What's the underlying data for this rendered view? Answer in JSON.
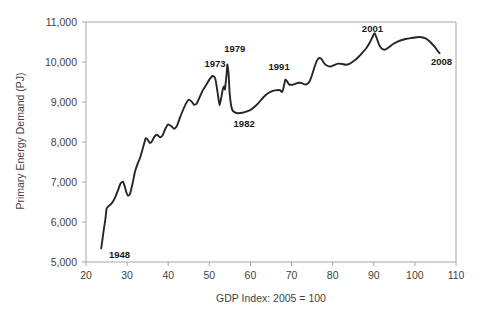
{
  "chart_data": {
    "type": "line",
    "title": "",
    "xlabel": "GDP Index: 2005 = 100",
    "ylabel": "Primary Energy Demand (PJ)",
    "xlim": [
      20,
      110
    ],
    "ylim": [
      5000,
      11000
    ],
    "xticks": [
      20,
      30,
      40,
      50,
      60,
      70,
      80,
      90,
      100,
      110
    ],
    "xtick_labels": [
      "20",
      "30",
      "40",
      "50",
      "60",
      "70",
      "80",
      "90",
      "100",
      "110"
    ],
    "yticks": [
      5000,
      6000,
      7000,
      8000,
      9000,
      10000,
      11000
    ],
    "ytick_labels": [
      "5,000",
      "6,000",
      "7,000",
      "8,000",
      "9,000",
      "10,000",
      "11,000"
    ],
    "grid": false,
    "legend": "none",
    "line_color": "#262626",
    "axis_color": "#a6a6a6",
    "text_color": "#3f3f3f",
    "annotations": [
      {
        "label": "1948",
        "x": 25.6,
        "y": 5180,
        "anchor": "start"
      },
      {
        "label": "1973",
        "x": 48.8,
        "y": 9960,
        "anchor": "start"
      },
      {
        "label": "1979",
        "x": 53.6,
        "y": 10330,
        "anchor": "start"
      },
      {
        "label": "1982",
        "x": 55.9,
        "y": 8460,
        "anchor": "start"
      },
      {
        "label": "1991",
        "x": 64.4,
        "y": 9880,
        "anchor": "start"
      },
      {
        "label": "2001",
        "x": 87.1,
        "y": 10830,
        "anchor": "start"
      },
      {
        "label": "2008",
        "x": 103.9,
        "y": 10010,
        "anchor": "start"
      }
    ],
    "series": [
      {
        "name": "Primary Energy Demand vs GDP Index",
        "points": [
          [
            23.7,
            5340
          ],
          [
            24.0,
            5560
          ],
          [
            24.3,
            5790
          ],
          [
            24.7,
            6060
          ],
          [
            25.0,
            6330
          ],
          [
            25.4,
            6390
          ],
          [
            26.0,
            6440
          ],
          [
            26.6,
            6520
          ],
          [
            27.2,
            6640
          ],
          [
            27.8,
            6800
          ],
          [
            28.4,
            6960
          ],
          [
            29.0,
            7010
          ],
          [
            29.4,
            6900
          ],
          [
            29.8,
            6750
          ],
          [
            30.2,
            6660
          ],
          [
            30.7,
            6700
          ],
          [
            31.3,
            6950
          ],
          [
            31.9,
            7250
          ],
          [
            32.5,
            7440
          ],
          [
            33.2,
            7620
          ],
          [
            33.9,
            7870
          ],
          [
            34.5,
            8090
          ],
          [
            35.0,
            8060
          ],
          [
            35.5,
            7980
          ],
          [
            36.0,
            8010
          ],
          [
            36.6,
            8130
          ],
          [
            37.3,
            8180
          ],
          [
            38.0,
            8120
          ],
          [
            38.6,
            8160
          ],
          [
            39.3,
            8330
          ],
          [
            40.0,
            8440
          ],
          [
            40.7,
            8400
          ],
          [
            41.4,
            8330
          ],
          [
            42.1,
            8400
          ],
          [
            42.9,
            8620
          ],
          [
            43.6,
            8800
          ],
          [
            44.3,
            8960
          ],
          [
            45.0,
            9060
          ],
          [
            45.7,
            9010
          ],
          [
            46.3,
            8930
          ],
          [
            46.9,
            8960
          ],
          [
            47.6,
            9110
          ],
          [
            48.4,
            9290
          ],
          [
            49.2,
            9420
          ],
          [
            50.0,
            9560
          ],
          [
            50.8,
            9650
          ],
          [
            51.4,
            9600
          ],
          [
            51.8,
            9380
          ],
          [
            52.2,
            9100
          ],
          [
            52.5,
            8920
          ],
          [
            52.9,
            9110
          ],
          [
            53.3,
            9330
          ],
          [
            53.6,
            9390
          ],
          [
            53.8,
            9310
          ],
          [
            53.9,
            9400
          ],
          [
            54.2,
            9700
          ],
          [
            54.4,
            9940
          ],
          [
            54.7,
            9680
          ],
          [
            54.9,
            9280
          ],
          [
            55.2,
            8980
          ],
          [
            55.6,
            8800
          ],
          [
            56.2,
            8740
          ],
          [
            57.0,
            8720
          ],
          [
            58.0,
            8730
          ],
          [
            59.0,
            8760
          ],
          [
            60.0,
            8800
          ],
          [
            61.0,
            8880
          ],
          [
            62.0,
            8980
          ],
          [
            63.0,
            9100
          ],
          [
            64.0,
            9200
          ],
          [
            65.0,
            9260
          ],
          [
            66.0,
            9290
          ],
          [
            66.8,
            9300
          ],
          [
            67.3,
            9290
          ],
          [
            67.6,
            9250
          ],
          [
            67.9,
            9300
          ],
          [
            68.2,
            9430
          ],
          [
            68.5,
            9560
          ],
          [
            68.9,
            9520
          ],
          [
            69.4,
            9440
          ],
          [
            70.2,
            9430
          ],
          [
            71.0,
            9460
          ],
          [
            71.8,
            9480
          ],
          [
            72.5,
            9470
          ],
          [
            73.2,
            9440
          ],
          [
            73.8,
            9450
          ],
          [
            74.4,
            9520
          ],
          [
            75.0,
            9680
          ],
          [
            75.6,
            9880
          ],
          [
            76.2,
            10040
          ],
          [
            76.8,
            10100
          ],
          [
            77.4,
            10060
          ],
          [
            78.0,
            9960
          ],
          [
            78.8,
            9900
          ],
          [
            79.6,
            9890
          ],
          [
            80.5,
            9930
          ],
          [
            81.4,
            9960
          ],
          [
            82.3,
            9950
          ],
          [
            83.2,
            9930
          ],
          [
            84.2,
            9960
          ],
          [
            85.2,
            10030
          ],
          [
            86.2,
            10120
          ],
          [
            87.2,
            10230
          ],
          [
            88.2,
            10350
          ],
          [
            89.0,
            10480
          ],
          [
            89.7,
            10630
          ],
          [
            90.2,
            10720
          ],
          [
            90.7,
            10600
          ],
          [
            91.3,
            10430
          ],
          [
            92.0,
            10330
          ],
          [
            92.8,
            10310
          ],
          [
            93.7,
            10370
          ],
          [
            94.7,
            10450
          ],
          [
            95.8,
            10510
          ],
          [
            96.9,
            10550
          ],
          [
            98.0,
            10580
          ],
          [
            99.2,
            10600
          ],
          [
            100.4,
            10620
          ],
          [
            101.6,
            10620
          ],
          [
            102.6,
            10590
          ],
          [
            103.4,
            10530
          ],
          [
            104.2,
            10450
          ],
          [
            104.9,
            10370
          ],
          [
            105.5,
            10280
          ],
          [
            106.0,
            10220
          ]
        ]
      }
    ]
  }
}
